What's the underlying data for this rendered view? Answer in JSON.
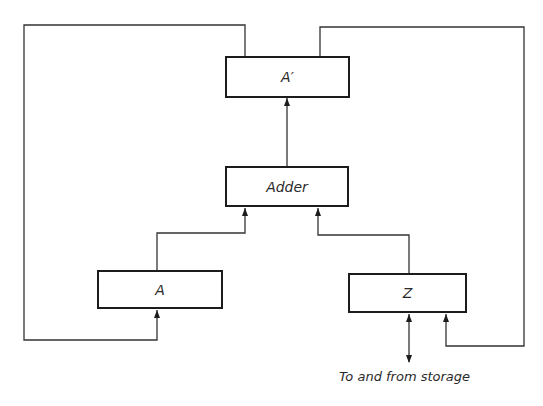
{
  "diagram": {
    "type": "block-diagram",
    "colors": {
      "line": "#333333",
      "box_border": "#1c1c1c",
      "text": "#2a2a2a",
      "background": "#ffffff"
    },
    "nodes": [
      {
        "id": "a_prime",
        "label": "A′"
      },
      {
        "id": "adder",
        "label": "Adder"
      },
      {
        "id": "a",
        "label": "A"
      },
      {
        "id": "z",
        "label": "Z"
      }
    ],
    "edges": [
      {
        "from": "adder",
        "to": "a_prime",
        "directed": true
      },
      {
        "from": "a",
        "to": "adder",
        "directed": true
      },
      {
        "from": "z",
        "to": "adder",
        "directed": true
      },
      {
        "from": "a_prime",
        "to": "a",
        "directed": true,
        "route": "left loop"
      },
      {
        "from": "a_prime",
        "to": "z",
        "directed": true,
        "route": "right loop"
      },
      {
        "from": "z",
        "to": "storage",
        "directed": true,
        "bidirectional": true
      }
    ],
    "caption": "To and from storage"
  }
}
